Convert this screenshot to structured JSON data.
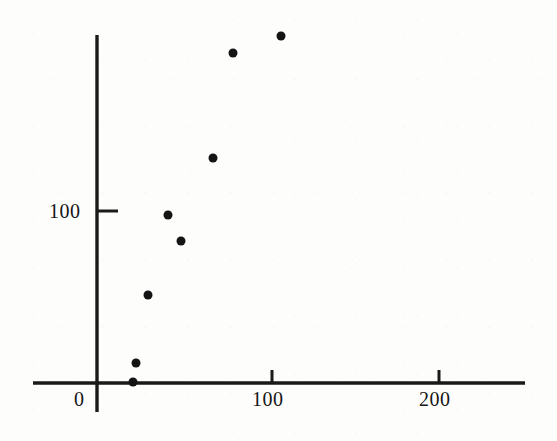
{
  "figure": {
    "background_color": "#fdfdfc",
    "ink_color": "#141414",
    "width": 557,
    "height": 441
  },
  "axes": {
    "y_axis_pixel_x": 97,
    "x_axis_pixel_y": 383,
    "x_axis_pixel_left": 33,
    "x_axis_pixel_right": 525,
    "y_axis_pixel_top": 35,
    "y_axis_pixel_bottom": 412,
    "x_px_per_unit": 1.71,
    "y_px_per_unit": 1.72
  },
  "labels": {
    "origin": "0",
    "x_tick_100": "100",
    "x_tick_200": "200",
    "y_tick_100": "100"
  },
  "chart_data": {
    "type": "scatter",
    "title": "",
    "xlabel": "",
    "ylabel": "",
    "xlim": [
      -37,
      250
    ],
    "ylim": [
      -17,
      202
    ],
    "grid": false,
    "legend": null,
    "xticks": [
      0,
      100,
      200
    ],
    "xticklabels": [
      "0",
      "100",
      "200"
    ],
    "yticks": [
      100
    ],
    "yticklabels": [
      "100"
    ],
    "marker": "filled-circle",
    "marker_size_px": 9,
    "point_count": 8,
    "x": [
      21,
      23,
      30,
      42,
      49,
      68,
      80,
      108
    ],
    "y": [
      1,
      12,
      51,
      98,
      83,
      131,
      192,
      202
    ],
    "points": [
      {
        "x": 21,
        "y": 1,
        "px": 133,
        "py": 382
      },
      {
        "x": 23,
        "y": 12,
        "px": 136,
        "py": 363
      },
      {
        "x": 30,
        "y": 51,
        "px": 148,
        "py": 295
      },
      {
        "x": 42,
        "y": 98,
        "px": 168,
        "py": 215
      },
      {
        "x": 49,
        "y": 83,
        "px": 181,
        "py": 241
      },
      {
        "x": 68,
        "y": 131,
        "px": 213,
        "py": 158
      },
      {
        "x": 80,
        "y": 192,
        "px": 233,
        "py": 53
      },
      {
        "x": 108,
        "y": 202,
        "px": 281,
        "py": 36
      }
    ]
  }
}
